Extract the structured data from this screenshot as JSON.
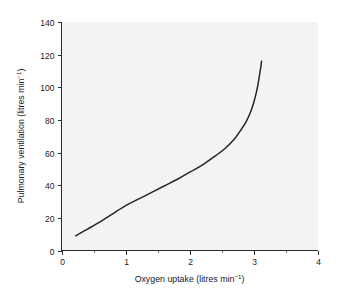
{
  "chart_data": {
    "type": "line",
    "title": "",
    "xlabel": "Oxygen uptake (litres min",
    "xlabel_sup": "−1",
    "xlabel_tail": ")",
    "ylabel": "Pulmonary ventilation (litres min",
    "ylabel_sup": "−1",
    "ylabel_tail": ")",
    "xlim": [
      0,
      4
    ],
    "ylim": [
      0,
      140
    ],
    "xticks": [
      0,
      1,
      2,
      3,
      4
    ],
    "xtick_labels": [
      "0",
      "1",
      "2",
      "3",
      "4"
    ],
    "x_minor_ticks": [
      0.5,
      1.5,
      2.5,
      3.5
    ],
    "yticks": [
      0,
      20,
      40,
      60,
      80,
      100,
      120,
      140
    ],
    "ytick_labels": [
      "0",
      "20",
      "40",
      "60",
      "80",
      "100",
      "120",
      "140"
    ],
    "grid": false,
    "legend": null,
    "series": [
      {
        "name": "Pulmonary ventilation response",
        "color": "#262626",
        "x": [
          0.22,
          0.4,
          0.6,
          0.8,
          1.0,
          1.2,
          1.4,
          1.6,
          1.8,
          2.0,
          2.2,
          2.4,
          2.55,
          2.7,
          2.8,
          2.88,
          2.95,
          3.0,
          3.04,
          3.07,
          3.09,
          3.11,
          3.12
        ],
        "y": [
          9,
          13,
          17.5,
          22.5,
          27.5,
          31.5,
          35.5,
          39.5,
          43.5,
          48,
          52.5,
          58,
          62.5,
          68.5,
          74,
          79,
          85,
          91,
          97,
          103,
          108,
          113,
          116
        ]
      }
    ],
    "annotations": []
  },
  "figure": {
    "background_color": "#ffffff",
    "plot_background_color": "#f3f3f3",
    "axis_color": "#2b2b2b",
    "text_color": "#1a1a1a"
  }
}
